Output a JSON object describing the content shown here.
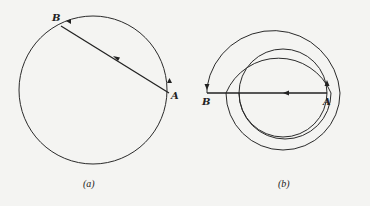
{
  "figure": {
    "panels": [
      {
        "id": "a",
        "caption": "(a)",
        "labels": {
          "start": "A",
          "end": "B"
        },
        "description": "Circle with chord from A to B; arc from A going up/counterclockwise to B"
      },
      {
        "id": "b",
        "caption": "(b)",
        "labels": {
          "start": "A",
          "end": "B"
        },
        "description": "Spiral path of increasing radius from A winding around to B; straight line from A to B"
      }
    ],
    "colors": {
      "ink": "#222222",
      "background": "#f4f4f2"
    }
  }
}
